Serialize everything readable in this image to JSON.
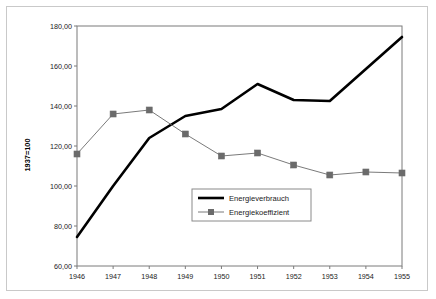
{
  "chart_data": {
    "type": "line",
    "title": "",
    "subtitle": "",
    "xlabel": "",
    "ylabel": "1937=100",
    "categories": [
      "1946",
      "1947",
      "1948",
      "1949",
      "1950",
      "1951",
      "1952",
      "1953",
      "1954",
      "1955"
    ],
    "x": [
      1946,
      1947,
      1948,
      1949,
      1950,
      1951,
      1952,
      1953,
      1954,
      1955
    ],
    "xlim": [
      1946,
      1955
    ],
    "ylim": [
      60,
      180
    ],
    "ytick_values": [
      60,
      80,
      100,
      120,
      140,
      160,
      180
    ],
    "ytick_labels": [
      "60,00",
      "80,00",
      "100,00",
      "120,00",
      "140,00",
      "160,00",
      "180,00"
    ],
    "xtick_labels": [
      "1946",
      "1947",
      "1948",
      "1949",
      "1950",
      "1951",
      "1952",
      "1953",
      "1954",
      "1955"
    ],
    "grid": false,
    "legend_position": "center-right-inside",
    "series": [
      {
        "name": "Energieverbrauch",
        "color": "#000000",
        "line_width": 2.6,
        "marker": "none",
        "values": [
          74.5,
          100.0,
          124.0,
          135.0,
          138.5,
          151.0,
          143.0,
          142.5,
          158.5,
          174.5
        ]
      },
      {
        "name": "Energiekoeffizient",
        "color": "#6b6b6b",
        "line_width": 0.9,
        "marker": "square",
        "values": [
          116.0,
          136.0,
          138.0,
          126.0,
          115.0,
          116.5,
          110.5,
          105.5,
          107.0,
          106.5
        ]
      }
    ]
  },
  "legend": {
    "items": [
      {
        "label": "Energieverbrauch",
        "marker": "line"
      },
      {
        "label": "Energiekoeffizient",
        "marker": "line-square"
      }
    ]
  },
  "axes": {
    "y_title": "1937=100"
  },
  "colors": {
    "series_primary": "#000000",
    "series_secondary": "#6b6b6b",
    "axis": "#7b7b7b",
    "frame": "#c9c9c9",
    "text": "#1a1a1a"
  }
}
